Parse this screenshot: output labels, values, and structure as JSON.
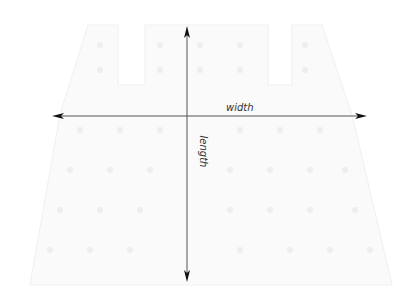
{
  "diagram": {
    "labels": {
      "width": "width",
      "length": "length"
    },
    "colors": {
      "arrow": "#1a1a1a",
      "garment_outline": "#f2f2f2",
      "background": "#ffffff"
    },
    "background_shape": "faint knit skirt/garment silhouette with lace pattern"
  }
}
